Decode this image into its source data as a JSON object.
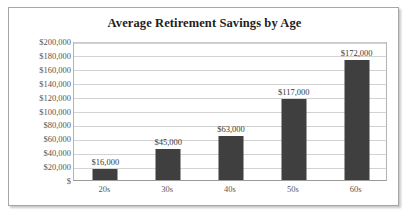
{
  "chart_data": {
    "type": "bar",
    "title": "Average Retirement Savings by Age",
    "xlabel": "",
    "ylabel": "",
    "categories": [
      "20s",
      "30s",
      "40s",
      "50s",
      "60s"
    ],
    "values": [
      16000,
      45000,
      63000,
      117000,
      172000
    ],
    "data_labels": [
      "$16,000",
      "$45,000",
      "$63,000",
      "$117,000",
      "$172,000"
    ],
    "ylim": [
      0,
      200000
    ],
    "ytick_values": [
      0,
      20000,
      40000,
      60000,
      80000,
      100000,
      120000,
      140000,
      160000,
      180000,
      200000
    ],
    "ytick_labels": [
      "$",
      "$20,000",
      "$40,000",
      "$60,000",
      "$80,000",
      "$100,000",
      "$120,000",
      "$140,000",
      "$160,000",
      "$180,000",
      "$200,000"
    ],
    "grid": true,
    "legend": "none",
    "bar_color": "#3f3f3f",
    "gridline_color": "#d2d2d2",
    "background_color": "#ffffff",
    "border_color": "#a6a6a6"
  }
}
